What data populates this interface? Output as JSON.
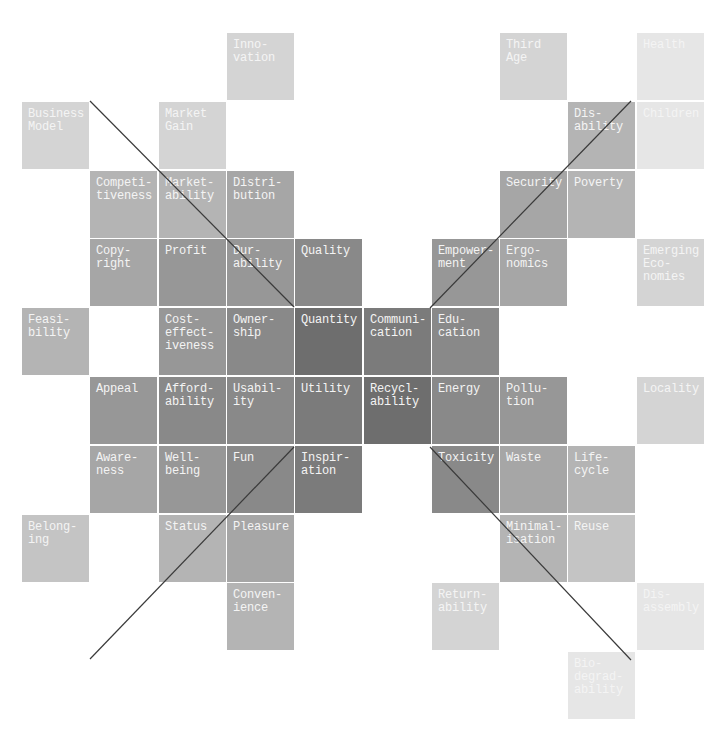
{
  "diagram": {
    "grid": {
      "origin_x": 22,
      "origin_y": 33,
      "pitch_x": 68.3,
      "pitch_y": 68.8,
      "cell_size": 67
    },
    "shades": {
      "1": "#e6e6e6",
      "2": "#d4d4d4",
      "3": "#c4c4c4",
      "4": "#b4b4b4",
      "5": "#a6a6a6",
      "6": "#979797",
      "7": "#898989",
      "8": "#7b7b7b",
      "9": "#6e6e6e"
    },
    "cells": [
      {
        "col": 3,
        "row": 0,
        "label": "Inno-\nvation",
        "shade": 2
      },
      {
        "col": 7,
        "row": 0,
        "label": "Third\nAge",
        "shade": 2
      },
      {
        "col": 9,
        "row": 0,
        "label": "Health",
        "shade": 1
      },
      {
        "col": 0,
        "row": 1,
        "label": "Business\nModel",
        "shade": 2
      },
      {
        "col": 2,
        "row": 1,
        "label": "Market\nGain",
        "shade": 2
      },
      {
        "col": 8,
        "row": 1,
        "label": "Dis-\nability",
        "shade": 4
      },
      {
        "col": 9,
        "row": 1,
        "label": "Children",
        "shade": 1
      },
      {
        "col": 1,
        "row": 2,
        "label": "Competi-\ntiveness",
        "shade": 4
      },
      {
        "col": 2,
        "row": 2,
        "label": "Market-\nability",
        "shade": 4
      },
      {
        "col": 3,
        "row": 2,
        "label": "Distri-\nbution",
        "shade": 5
      },
      {
        "col": 7,
        "row": 2,
        "label": "Security",
        "shade": 5
      },
      {
        "col": 8,
        "row": 2,
        "label": "Poverty",
        "shade": 4
      },
      {
        "col": 1,
        "row": 3,
        "label": "Copy-\nright",
        "shade": 5
      },
      {
        "col": 2,
        "row": 3,
        "label": "Profit",
        "shade": 6
      },
      {
        "col": 3,
        "row": 3,
        "label": "Dur-\nability",
        "shade": 6
      },
      {
        "col": 4,
        "row": 3,
        "label": "Quality",
        "shade": 7
      },
      {
        "col": 6,
        "row": 3,
        "label": "Empower-\nment",
        "shade": 6
      },
      {
        "col": 7,
        "row": 3,
        "label": "Ergo-\nnomics",
        "shade": 5
      },
      {
        "col": 9,
        "row": 3,
        "label": "Emerging\nEco-\nnomies",
        "shade": 2
      },
      {
        "col": 0,
        "row": 4,
        "label": "Feasi-\nbility",
        "shade": 4
      },
      {
        "col": 2,
        "row": 4,
        "label": "Cost-\neffect-\niveness",
        "shade": 6
      },
      {
        "col": 3,
        "row": 4,
        "label": "Owner-\nship",
        "shade": 7
      },
      {
        "col": 4,
        "row": 4,
        "label": "Quantity",
        "shade": 9
      },
      {
        "col": 5,
        "row": 4,
        "label": "Communi-\ncation",
        "shade": 8
      },
      {
        "col": 6,
        "row": 4,
        "label": "Edu-\ncation",
        "shade": 7
      },
      {
        "col": 1,
        "row": 5,
        "label": "Appeal",
        "shade": 6
      },
      {
        "col": 2,
        "row": 5,
        "label": "Afford-\nability",
        "shade": 7
      },
      {
        "col": 3,
        "row": 5,
        "label": "Usabil-\nity",
        "shade": 7
      },
      {
        "col": 4,
        "row": 5,
        "label": "Utility",
        "shade": 8
      },
      {
        "col": 5,
        "row": 5,
        "label": "Recycl-\nability",
        "shade": 9
      },
      {
        "col": 6,
        "row": 5,
        "label": "Energy",
        "shade": 7
      },
      {
        "col": 7,
        "row": 5,
        "label": "Pollu-\ntion",
        "shade": 6
      },
      {
        "col": 9,
        "row": 5,
        "label": "Locality",
        "shade": 2
      },
      {
        "col": 1,
        "row": 6,
        "label": "Aware-\nness",
        "shade": 5
      },
      {
        "col": 2,
        "row": 6,
        "label": "Well-\nbeing",
        "shade": 6
      },
      {
        "col": 3,
        "row": 6,
        "label": "Fun",
        "shade": 7
      },
      {
        "col": 4,
        "row": 6,
        "label": "Inspir-\nation",
        "shade": 8
      },
      {
        "col": 6,
        "row": 6,
        "label": "Toxicity",
        "shade": 7
      },
      {
        "col": 7,
        "row": 6,
        "label": "Waste",
        "shade": 5
      },
      {
        "col": 8,
        "row": 6,
        "label": "Life-\ncycle",
        "shade": 4
      },
      {
        "col": 0,
        "row": 7,
        "label": "Belong-\ning",
        "shade": 3
      },
      {
        "col": 2,
        "row": 7,
        "label": "Status",
        "shade": 4
      },
      {
        "col": 3,
        "row": 7,
        "label": "Pleasure",
        "shade": 5
      },
      {
        "col": 7,
        "row": 7,
        "label": "Minimal-\nisation",
        "shade": 4
      },
      {
        "col": 8,
        "row": 7,
        "label": "Reuse",
        "shade": 3
      },
      {
        "col": 3,
        "row": 8,
        "label": "Conven-\nience",
        "shade": 4
      },
      {
        "col": 6,
        "row": 8,
        "label": "Return-\nability",
        "shade": 2
      },
      {
        "col": 9,
        "row": 8,
        "label": "Dis-\nassembly",
        "shade": 1
      },
      {
        "col": 8,
        "row": 9,
        "label": "Bio-\ndegrad-\nability",
        "shade": 1
      }
    ],
    "lines": [
      {
        "x1": 90,
        "y1": 101,
        "x2": 294,
        "y2": 307
      },
      {
        "x1": 430,
        "y1": 308,
        "x2": 631,
        "y2": 101
      },
      {
        "x1": 90,
        "y1": 659,
        "x2": 294,
        "y2": 447
      },
      {
        "x1": 430,
        "y1": 447,
        "x2": 631,
        "y2": 660
      }
    ],
    "line_color": "#3a3a3a"
  }
}
